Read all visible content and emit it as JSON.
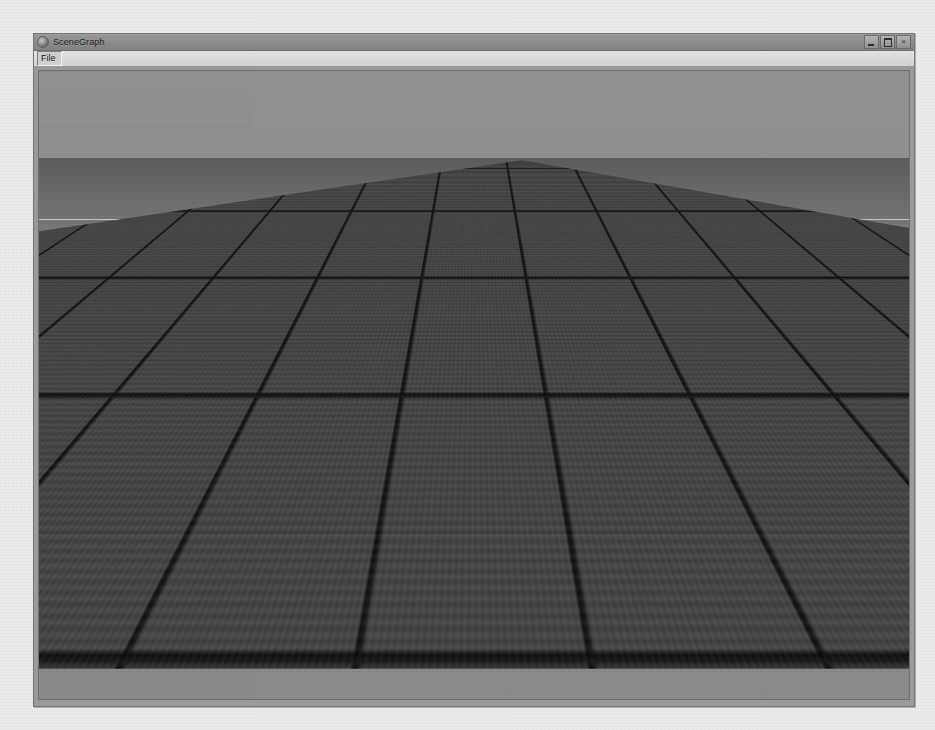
{
  "window": {
    "title": "SceneGraph",
    "icon": "app-icon",
    "controls": {
      "minimize": "minimize-icon",
      "maximize": "maximize-icon",
      "close": "×"
    }
  },
  "menu": {
    "items": [
      {
        "label": "File"
      }
    ]
  },
  "viewport": {
    "name": "3d-viewport",
    "scene": {
      "objects": [
        {
          "name": "teapot",
          "type": "utah-teapot"
        },
        {
          "name": "ground-plane",
          "type": "grid-floor"
        },
        {
          "name": "target-line",
          "type": "line"
        },
        {
          "name": "cross-product-arrow",
          "type": "arrow",
          "direction": "up"
        },
        {
          "name": "direction-arrow",
          "type": "arrow",
          "direction": "up-left"
        },
        {
          "name": "target-arrow",
          "type": "arrow",
          "direction": "right"
        }
      ],
      "labels": [
        {
          "id": "cross",
          "text": "The Cross Product"
        },
        {
          "id": "direction",
          "text": "Your Direction"
        },
        {
          "id": "target",
          "text": "Your Target"
        }
      ]
    }
  },
  "colors": {
    "sky": "#8c8c8c",
    "ground": "#3f3f3f",
    "grid_line": "#0c0c0c",
    "label_text": "#f4f4f4",
    "title_bar": "#8a8a8a",
    "menu_bar": "#d6d6d4",
    "window_chrome": "#9a9a9a",
    "desktop": "#ebebe9",
    "cross_arrow": "#d8d8d8",
    "direction_arrow": "#f0f0f0",
    "target_arrow": "#4a4a4a",
    "target_line": "#f5f5f5",
    "teapot": "#c8c8c8"
  }
}
